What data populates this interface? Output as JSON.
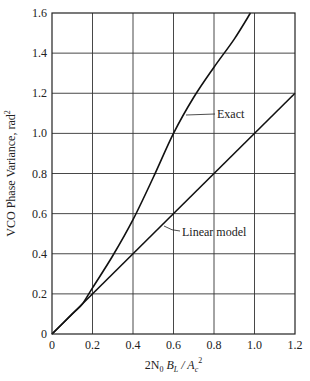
{
  "chart_data": {
    "type": "line",
    "title": "",
    "xlabel": "2N₀ B_L / A_c²",
    "xlabel_parts": {
      "main": "2N",
      "sub0": "0",
      "mid": " B",
      "subL": "L",
      "slash": " / A",
      "subc": "c",
      "sup": "2"
    },
    "ylabel": "VCO Phase Variance, rad²",
    "ylabel_parts": {
      "main": "VCO Phase Variance, rad",
      "sup": "2"
    },
    "xlim": [
      0,
      1.2
    ],
    "ylim": [
      0,
      1.6
    ],
    "grid": true,
    "x_ticks": [
      0,
      0.2,
      0.4,
      0.6,
      0.8,
      1.0,
      1.2
    ],
    "x_tick_labels": [
      "0",
      "0.2",
      "0.4",
      "0.6",
      "0.8",
      "1.0",
      "1.2"
    ],
    "y_ticks": [
      0,
      0.2,
      0.4,
      0.6,
      0.8,
      1.0,
      1.2,
      1.4,
      1.6
    ],
    "y_tick_labels": [
      "0",
      "0.2",
      "0.4",
      "0.6",
      "0.8",
      "1.0",
      "1.2",
      "1.4",
      "1.6"
    ],
    "series": [
      {
        "name": "Exact",
        "x": [
          0,
          0.1,
          0.15,
          0.2,
          0.3,
          0.4,
          0.5,
          0.6,
          0.7,
          0.8,
          0.9,
          0.98
        ],
        "y": [
          0,
          0.1,
          0.15,
          0.23,
          0.39,
          0.57,
          0.78,
          1.0,
          1.18,
          1.33,
          1.47,
          1.6
        ]
      },
      {
        "name": "Linear model",
        "x": [
          0,
          1.2
        ],
        "y": [
          0,
          1.2
        ]
      }
    ],
    "annotations": [
      {
        "text": "Exact",
        "points_to": [
          0.55,
          0.9
        ]
      },
      {
        "text": "Linear model",
        "points_to": [
          0.55,
          0.53
        ]
      }
    ]
  }
}
